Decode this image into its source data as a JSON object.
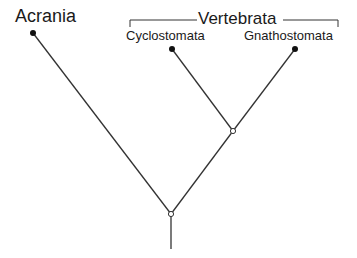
{
  "diagram": {
    "type": "cladogram",
    "taxa": [
      {
        "name": "Acrania",
        "x": 33,
        "y": 33
      },
      {
        "name": "Cyclostomata",
        "x": 172,
        "y": 49
      },
      {
        "name": "Gnathostomata",
        "x": 295,
        "y": 49
      }
    ],
    "group": {
      "label": "Vertebrata",
      "members": [
        "Cyclostomata",
        "Gnathostomata"
      ]
    },
    "nodes": [
      {
        "id": "vertebrata-node",
        "x": 233,
        "y": 131,
        "children": [
          "Cyclostomata",
          "Gnathostomata"
        ]
      },
      {
        "id": "root-node",
        "x": 171,
        "y": 214,
        "children": [
          "Acrania",
          "vertebrata-node"
        ]
      }
    ],
    "colors": {
      "line": "#333333",
      "terminal_dot": "#111111",
      "node_fill": "#ffffff"
    }
  }
}
